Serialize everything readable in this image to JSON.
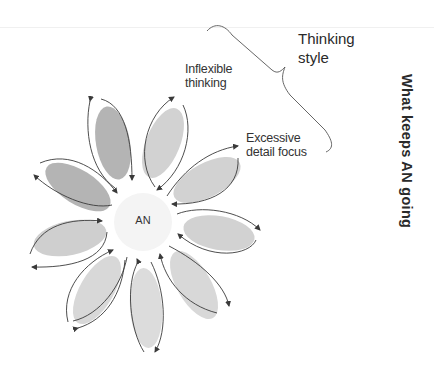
{
  "diagram": {
    "title": "What keeps AN going",
    "center": {
      "label": "AN",
      "fill": "#f4f4f4"
    },
    "brace_label": "Thinking style",
    "brace_label_lines": [
      "Thinking",
      "style"
    ],
    "petal_labels": [
      {
        "id": "inflexible-thinking",
        "lines": [
          "Inflexible",
          "thinking"
        ]
      },
      {
        "id": "excessive-detail-focus",
        "lines": [
          "Excessive",
          "detail focus"
        ]
      }
    ],
    "petal_count": 9,
    "colors": {
      "petal_dark": "#b4b4b4",
      "petal_light": "#d2d2d2",
      "petal_lighter": "#dcdcdc",
      "arrow": "#3a3a3a",
      "text": "#333333",
      "background": "#ffffff"
    }
  }
}
